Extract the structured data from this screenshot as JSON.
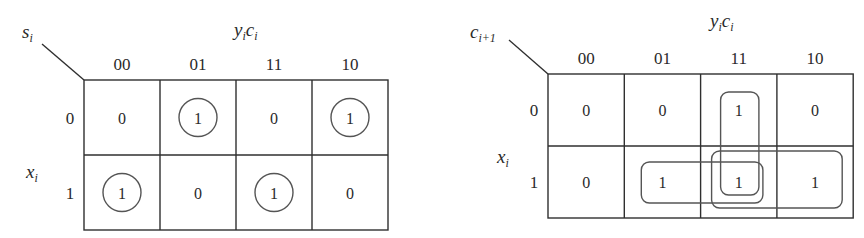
{
  "kmaps": [
    {
      "id": "sum",
      "output_var": {
        "base": "s",
        "sub": "i"
      },
      "col_var": [
        {
          "base": "y",
          "sub": "i"
        },
        {
          "base": "c",
          "sub": "i"
        }
      ],
      "row_var": {
        "base": "x",
        "sub": "i"
      },
      "col_labels": [
        "00",
        "01",
        "11",
        "10"
      ],
      "row_labels": [
        "0",
        "1"
      ],
      "cells": [
        [
          "0",
          "1",
          "0",
          "1"
        ],
        [
          "1",
          "0",
          "1",
          "0"
        ]
      ],
      "circled": [
        [
          0,
          1
        ],
        [
          0,
          3
        ],
        [
          1,
          0
        ],
        [
          1,
          2
        ]
      ],
      "groups": []
    },
    {
      "id": "carry",
      "output_var": {
        "base": "c",
        "sub": "i+1"
      },
      "col_var": [
        {
          "base": "y",
          "sub": "i"
        },
        {
          "base": "c",
          "sub": "i"
        }
      ],
      "row_var": {
        "base": "x",
        "sub": "i"
      },
      "col_labels": [
        "00",
        "01",
        "11",
        "10"
      ],
      "row_labels": [
        "0",
        "1"
      ],
      "cells": [
        [
          "0",
          "0",
          "1",
          "0"
        ],
        [
          "0",
          "1",
          "1",
          "1"
        ]
      ],
      "circled": [],
      "groups": [
        {
          "name": "yi-ci",
          "cells": [
            [
              0,
              2
            ],
            [
              1,
              2
            ]
          ]
        },
        {
          "name": "xi-ci",
          "cells": [
            [
              1,
              1
            ],
            [
              1,
              2
            ]
          ]
        },
        {
          "name": "xi-yi",
          "cells": [
            [
              1,
              2
            ],
            [
              1,
              3
            ]
          ]
        }
      ]
    }
  ]
}
